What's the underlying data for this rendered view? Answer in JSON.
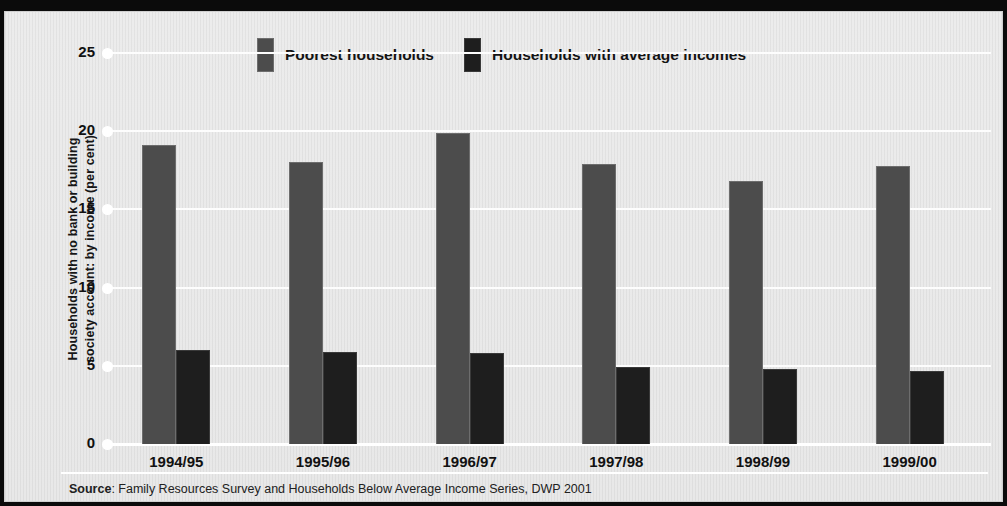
{
  "chart_data": {
    "type": "bar",
    "title": "",
    "ylabel": "Households with no bank or building society account: by income (per cent)",
    "xlabel": "",
    "categories": [
      "1994/95",
      "1995/96",
      "1996/97",
      "1997/98",
      "1998/99",
      "1999/00"
    ],
    "series": [
      {
        "name": "Poorest households",
        "color": "#4c4c4c",
        "values": [
          19.1,
          18.0,
          19.9,
          17.9,
          16.8,
          17.8
        ]
      },
      {
        "name": "Households with average incomes",
        "color": "#1e1e1e",
        "values": [
          6.0,
          5.9,
          5.8,
          4.9,
          4.8,
          4.7
        ]
      }
    ],
    "ylim": [
      0,
      25
    ],
    "yticks": [
      0,
      5,
      10,
      15,
      20,
      25
    ],
    "ytick_labels": [
      "0",
      "5",
      "10",
      "15",
      "20",
      "25"
    ],
    "grid": true,
    "legend_position": "top-center"
  },
  "axis": {
    "title_line1": "Households with no bank or building",
    "title_line2": "society account: by income (per cent)"
  },
  "legend": {
    "items": [
      {
        "label": "Poorest households"
      },
      {
        "label": "Households with average incomes"
      }
    ]
  },
  "source": {
    "prefix": "Source",
    "text": ": Family Resources Survey and Households Below Average Income Series, DWP 2001"
  },
  "colors": {
    "poorest": "#4c4c4c",
    "average": "#1e1e1e",
    "paper": "#ececec",
    "grid": "#ffffff",
    "frame": "#0b0b0b"
  }
}
